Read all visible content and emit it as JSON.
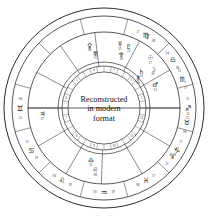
{
  "chart": {
    "title_lines": [
      "Reconstructed",
      "in modern",
      "format"
    ],
    "geometry": {
      "cx": 104,
      "cy": 108,
      "r_outer": 100,
      "r_sign_band_outer": 92,
      "r_sign_band_inner": 76,
      "r_house_wheel": 46,
      "r_inner_band_outer": 42,
      "r_inner_band_inner": 36,
      "ascendant_angle": 180
    },
    "colors": {
      "ink": "#1a1a1a",
      "line": "#3a3a3a",
      "paper": "#ffffff"
    },
    "zodiac_band": [
      {
        "name": "Aquarius",
        "glyph": "♒",
        "angle": 270,
        "deg_left": "19",
        "deg_right": "20"
      },
      {
        "name": "Pisces",
        "glyph": "♓",
        "angle": 300,
        "deg_left": "17",
        "deg_right": "06"
      },
      {
        "name": "Aries",
        "glyph": "♈",
        "angle": 325,
        "deg_left": "17",
        "deg_right": "11"
      },
      {
        "name": "Taurus",
        "glyph": "♉",
        "angle": 350,
        "deg_left": "13",
        "deg_right": "08"
      },
      {
        "name": "Gemini",
        "glyph": "♊",
        "angle": 180,
        "deg_left": "25",
        "deg_right": "06"
      },
      {
        "name": "Cancer",
        "glyph": "♋",
        "angle": 210,
        "deg_left": "19",
        "deg_right": "12"
      },
      {
        "name": "Leo",
        "glyph": "♌",
        "angle": 240,
        "deg_left": "19",
        "deg_right": "06"
      },
      {
        "name": "Virgo",
        "glyph": "♍",
        "angle": 60,
        "deg_left": "17",
        "deg_right": "06"
      },
      {
        "name": "Libra",
        "glyph": "♎",
        "angle": 35,
        "deg_left": "14",
        "deg_right": "08"
      },
      {
        "name": "Scorpio",
        "glyph": "♏",
        "angle": 20,
        "deg_left": "11",
        "deg_right": "17"
      },
      {
        "name": "Sagittarius",
        "glyph": "♐",
        "angle": 0,
        "deg_left": "11",
        "deg_right": "25"
      },
      {
        "name": "Capricorn",
        "glyph": "♑",
        "angle": 330,
        "deg_left": "17",
        "deg_right": "10"
      }
    ],
    "planets": [
      {
        "name": "Venus",
        "glyph": "♀",
        "angle": 103,
        "radius": 64,
        "label": "08"
      },
      {
        "name": "Uranus",
        "glyph": "♅",
        "angle": 99,
        "radius": 55,
        "label": "11"
      },
      {
        "name": "Mercury",
        "glyph": "☿",
        "angle": 76,
        "radius": 66,
        "label": "13"
      },
      {
        "name": "Pluto",
        "glyph": "♇",
        "angle": 68,
        "radius": 66,
        "label": "15"
      },
      {
        "name": "Neptune",
        "glyph": "♆",
        "angle": 72,
        "radius": 56,
        "label": "09"
      },
      {
        "name": "Sun",
        "glyph": "☉",
        "angle": 47,
        "radius": 68,
        "label": "17"
      },
      {
        "name": "Moon",
        "glyph": "☽",
        "angle": 38,
        "radius": 62,
        "label": "20"
      },
      {
        "name": "Saturn",
        "glyph": "♄",
        "angle": 44,
        "radius": 52,
        "label": "21"
      },
      {
        "name": "Chiron",
        "glyph": "⚷",
        "angle": 41,
        "radius": 45,
        "label": "08"
      },
      {
        "name": "Mars",
        "glyph": "♂",
        "angle": 24,
        "radius": 56,
        "label": "13"
      },
      {
        "name": "Jupiter",
        "glyph": "♃",
        "angle": 186,
        "radius": 62,
        "label": "27"
      },
      {
        "name": "Libra-2",
        "glyph": "♎",
        "angle": 256,
        "radius": 54,
        "label": "11"
      },
      {
        "name": "Leo-2",
        "glyph": "♌",
        "angle": 262,
        "radius": 63,
        "label": "08"
      }
    ],
    "house_numbers": [
      "1",
      "2",
      "3",
      "4",
      "5",
      "6",
      "7",
      "8",
      "9",
      "10",
      "11",
      "12"
    ]
  }
}
